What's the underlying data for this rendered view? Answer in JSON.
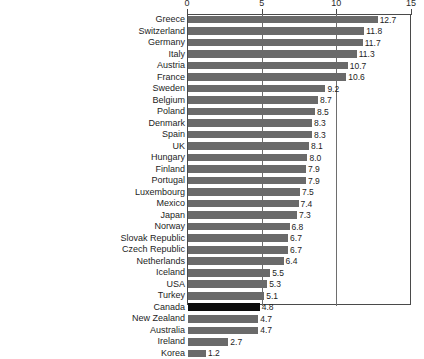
{
  "chart_data": {
    "type": "bar",
    "orientation": "horizontal",
    "title": "",
    "subtitle": "",
    "xlabel": "",
    "ylabel": "",
    "xlim": [
      0,
      15
    ],
    "xticks": [
      0,
      5,
      10,
      15
    ],
    "xtick_labels": [
      "0",
      "5",
      "10",
      "15"
    ],
    "grid": true,
    "grid_axis": "x",
    "legend": false,
    "legend_position": "none",
    "value_labels": true,
    "bar_color": "#6a6a6a",
    "highlight_color": "#0d0d0d",
    "highlight_category": "Canada",
    "axis_color": "#4a4a4a",
    "background": "#ffffff",
    "categories": [
      "Greece",
      "Switzerland",
      "Germany",
      "Italy",
      "Austria",
      "France",
      "Sweden",
      "Belgium",
      "Poland",
      "Denmark",
      "Spain",
      "UK",
      "Hungary",
      "Finland",
      "Portugal",
      "Luxembourg",
      "Mexico",
      "Japan",
      "Norway",
      "Slovak Republic",
      "Czech Republic",
      "Netherlands",
      "Iceland",
      "USA",
      "Turkey",
      "Canada",
      "New Zealand",
      "Australia",
      "Ireland",
      "Korea"
    ],
    "values": [
      12.7,
      11.8,
      11.7,
      11.3,
      10.7,
      10.6,
      9.2,
      8.7,
      8.5,
      8.3,
      8.3,
      8.1,
      8.0,
      7.9,
      7.9,
      7.5,
      7.4,
      7.3,
      6.8,
      6.7,
      6.7,
      6.4,
      5.5,
      5.3,
      5.1,
      4.8,
      4.7,
      4.7,
      2.7,
      1.2
    ],
    "value_label_texts": [
      "12.7",
      "11.8",
      "11.7",
      "11.3",
      "10.7",
      "10.6",
      "9.2",
      "8.7",
      "8.5",
      "8.3",
      "8.3",
      "8.1",
      "8.0",
      "7.9",
      "7.9",
      "7.5",
      "7.4",
      "7.3",
      "6.8",
      "6.7",
      "6.7",
      "6.4",
      "5.5",
      "5.3",
      "5.1",
      "4.8",
      "4.7",
      "4.7",
      "2.7",
      "1.2"
    ]
  }
}
